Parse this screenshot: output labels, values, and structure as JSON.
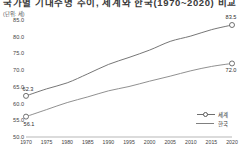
{
  "header": {
    "title": "국가별 기대수명 추이, 세계와 한국(1970~2020) 비교",
    "unit_label": "(단위: 세)"
  },
  "legend": {
    "position": "bottom-right",
    "items": [
      {
        "label": "세계",
        "marker": "open-circle-line",
        "color": "#6e6e6e"
      },
      {
        "label": "한국",
        "marker": "solid-line",
        "color": "#808080"
      }
    ]
  },
  "axis": {
    "y_ticks": [
      "85.0",
      "80.0",
      "75.0",
      "70.0",
      "65.0",
      "60.0",
      "55.0",
      "50.0"
    ],
    "x_ticks": [
      "1970",
      "1975",
      "1980",
      "1985",
      "1990",
      "1995",
      "2000",
      "2005",
      "2010",
      "2015",
      "2020"
    ]
  },
  "annotations": [
    {
      "name": "korea-start",
      "text": "62.3"
    },
    {
      "name": "korea-end",
      "text": "83.5"
    },
    {
      "name": "world-start",
      "text": "56.1"
    },
    {
      "name": "world-end",
      "text": "72.0"
    }
  ],
  "colors": {
    "line_korea": "#6f6f6f",
    "line_world": "#8a8a8a",
    "axis": "#9a9a9a",
    "text": "#333333"
  },
  "chart_data": {
    "type": "line",
    "title": "국가별 기대수명 추이, 세계와 한국(1970~2020) 비교",
    "subtitle": "(단위: 세)",
    "xlabel": "",
    "ylabel": "",
    "ylim": [
      50.0,
      85.0
    ],
    "ytick_values": [
      50.0,
      55.0,
      60.0,
      65.0,
      70.0,
      75.0,
      80.0,
      85.0
    ],
    "grid": false,
    "legend_position": "bottom-right",
    "x": [
      1970,
      1975,
      1980,
      1985,
      1990,
      1995,
      2000,
      2005,
      2010,
      2015,
      2020
    ],
    "series": [
      {
        "name": "한국",
        "values": [
          62.3,
          64.4,
          66.2,
          68.9,
          71.7,
          73.8,
          76.0,
          78.6,
          80.2,
          82.1,
          83.5
        ],
        "start_label": "62.3",
        "end_label": "83.5",
        "marker": "open-circle-endpoints"
      },
      {
        "name": "세계",
        "values": [
          56.1,
          58.2,
          60.3,
          62.0,
          63.8,
          65.1,
          66.7,
          68.2,
          69.8,
          71.1,
          72.0
        ],
        "start_label": "56.1",
        "end_label": "72.0",
        "marker": "open-circle-endpoints"
      }
    ]
  }
}
